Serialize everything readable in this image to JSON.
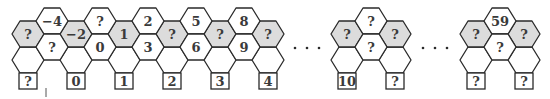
{
  "colors": {
    "stroke": "#2a2a2a",
    "grey_fill": "#dcdcdc",
    "white_fill": "#ffffff",
    "text": "#3a3a3a"
  },
  "hex": {
    "half_width": 16,
    "half_height": 13,
    "top_half_edge": 8
  },
  "square": {
    "size": 16
  },
  "strip": {
    "start_cx": 28,
    "column_step": 24,
    "even_columns": [
      {
        "grey": "?",
        "square": "?"
      },
      {
        "grey": "−2",
        "square": "0"
      },
      {
        "grey": "1",
        "square": "1"
      },
      {
        "grey": "?",
        "square": "2"
      },
      {
        "grey": "?",
        "square": "3"
      },
      {
        "grey": "?",
        "square": "4"
      }
    ],
    "odd_columns": [
      {
        "top": "−4",
        "middle": "?"
      },
      {
        "top": "?",
        "middle": "0"
      },
      {
        "top": "2",
        "middle": "3"
      },
      {
        "top": "5",
        "middle": "6"
      },
      {
        "top": "8",
        "middle": "9"
      }
    ]
  },
  "groups": [
    {
      "name": "middle-group",
      "left": {
        "cx": 347,
        "grey": "?",
        "square": "10"
      },
      "center": {
        "cx": 371,
        "top": "?",
        "middle": "?"
      },
      "right": {
        "cx": 395,
        "grey": "?",
        "square": "?"
      }
    },
    {
      "name": "right-group",
      "left": {
        "cx": 476,
        "grey": "?",
        "square": "?"
      },
      "center": {
        "cx": 500,
        "top": "59",
        "middle": "?"
      },
      "right": {
        "cx": 524,
        "grey": "?",
        "square": "?"
      }
    }
  ],
  "ellipses": [
    {
      "y": 48,
      "xs": [
        295,
        307,
        319
      ]
    },
    {
      "y": 48,
      "xs": [
        423,
        435,
        447
      ]
    }
  ],
  "tick_mark": {
    "x": 46,
    "y1": 88,
    "y2": 97
  },
  "rows": {
    "top_cy": 21,
    "grey_cy": 34,
    "middle_cy": 47,
    "blank_cy": 60,
    "square_top": 73
  }
}
